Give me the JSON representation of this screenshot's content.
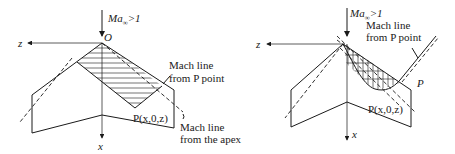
{
  "figures": [
    {
      "id": "left",
      "mach_label": "Ma",
      "mach_sub": "∞",
      "mach_rest": ">1",
      "origin_label": "O",
      "z_label": "z",
      "x_label": "x",
      "point_label": "P(x,0,z)",
      "callout_p_line1": "Mach line",
      "callout_p_line2": "from P point",
      "callout_apex_line1": "Mach line",
      "callout_apex_line2": "from the apex"
    },
    {
      "id": "right",
      "mach_label": "Ma",
      "mach_sub": "∞",
      "mach_rest": ">1",
      "z_label": "z",
      "x_label": "x",
      "point_label": "P(x,0,z)",
      "p_label": "P",
      "callout_p_line1": "Mach line",
      "callout_p_line2": "from P point"
    }
  ],
  "colors": {
    "line": "#1a1a1a",
    "background": "#ffffff"
  }
}
